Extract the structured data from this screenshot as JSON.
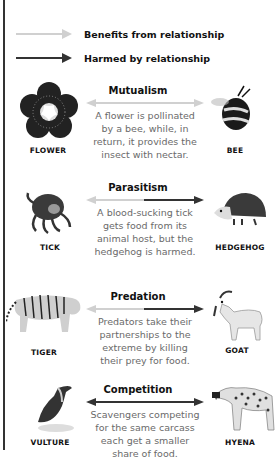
{
  "legend": {
    "benefits": {
      "label": "Benefits from relationship",
      "color": "#d0d0d0"
    },
    "harmed": {
      "label": "Harmed by relationship",
      "color": "#333333"
    }
  },
  "relationships": [
    {
      "title": "Mutualism",
      "description_lines": [
        "A flower is pollinated",
        "by a bee, while, in",
        "return, it provides the",
        "insect with nectar."
      ],
      "left": {
        "label": "FLOWER",
        "icon": "flower-icon"
      },
      "right": {
        "label": "BEE",
        "icon": "bee-icon"
      },
      "left_arrow": "benefits",
      "right_arrow": "benefits"
    },
    {
      "title": "Parasitism",
      "description_lines": [
        "A blood-sucking tick",
        "gets food from its",
        "animal host, but the",
        "hedgehog is harmed."
      ],
      "left": {
        "label": "TICK",
        "icon": "tick-icon"
      },
      "right": {
        "label": "HEDGEHOG",
        "icon": "hedgehog-icon"
      },
      "left_arrow": "benefits",
      "right_arrow": "harmed"
    },
    {
      "title": "Predation",
      "description_lines": [
        "Predators take their",
        "partnerships to the",
        "extreme by killing",
        "their prey for food."
      ],
      "left": {
        "label": "TIGER",
        "icon": "tiger-icon"
      },
      "right": {
        "label": "GOAT",
        "icon": "goat-icon"
      },
      "left_arrow": "benefits",
      "right_arrow": "harmed"
    },
    {
      "title": "Competition",
      "description_lines": [
        "Scavengers competing",
        "for the same carcass",
        "each get a smaller",
        "share of food."
      ],
      "left": {
        "label": "VULTURE",
        "icon": "vulture-icon"
      },
      "right": {
        "label": "HYENA",
        "icon": "hyena-icon"
      },
      "left_arrow": "harmed",
      "right_arrow": "harmed"
    }
  ]
}
